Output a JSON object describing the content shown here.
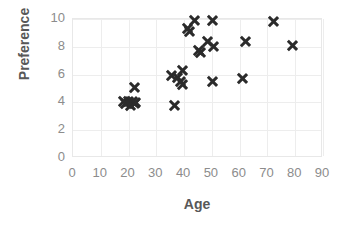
{
  "chart_data": {
    "type": "scatter",
    "title": "",
    "xlabel": "Age",
    "ylabel": "Preference",
    "xlim": [
      0,
      90
    ],
    "ylim": [
      0,
      10
    ],
    "xticks": [
      0,
      10,
      20,
      30,
      40,
      50,
      60,
      70,
      80,
      90
    ],
    "yticks": [
      0,
      2,
      4,
      6,
      8,
      10
    ],
    "xtick_labels": [
      "0",
      "10",
      "20",
      "30",
      "40",
      "50",
      "60",
      "70",
      "80",
      "90"
    ],
    "ytick_labels": [
      "0",
      "2",
      "4",
      "6",
      "8",
      "10"
    ],
    "grid": true,
    "legend": false,
    "marker": "x",
    "marker_color": "#2b2b2b",
    "series": [
      {
        "name": "Preference vs Age",
        "points": [
          [
            18.0,
            4.1
          ],
          [
            19.0,
            3.9
          ],
          [
            20.0,
            4.1
          ],
          [
            20.5,
            3.8
          ],
          [
            21.5,
            4.1
          ],
          [
            22.0,
            3.9
          ],
          [
            22.5,
            4.0
          ],
          [
            22.0,
            5.1
          ],
          [
            36.5,
            3.8
          ],
          [
            35.5,
            5.9
          ],
          [
            37.5,
            5.8
          ],
          [
            38.5,
            5.5
          ],
          [
            39.5,
            6.3
          ],
          [
            39.5,
            5.3
          ],
          [
            41.0,
            9.3
          ],
          [
            42.0,
            9.1
          ],
          [
            43.5,
            9.9
          ],
          [
            45.0,
            7.7
          ],
          [
            46.0,
            7.6
          ],
          [
            48.5,
            8.4
          ],
          [
            50.0,
            9.9
          ],
          [
            50.5,
            8.0
          ],
          [
            50.0,
            5.5
          ],
          [
            61.0,
            5.7
          ],
          [
            62.0,
            8.4
          ],
          [
            72.0,
            9.8
          ],
          [
            79.0,
            8.1
          ]
        ]
      }
    ]
  },
  "axes": {
    "x_title": "Age",
    "y_title": "Preference"
  },
  "colors": {
    "marker": "#2b2b2b",
    "gridline": "#ededed",
    "axis_border": "#e8e8e8",
    "tick_text": "#8c8c8c",
    "axis_title_text": "#585858",
    "background": "#ffffff"
  }
}
